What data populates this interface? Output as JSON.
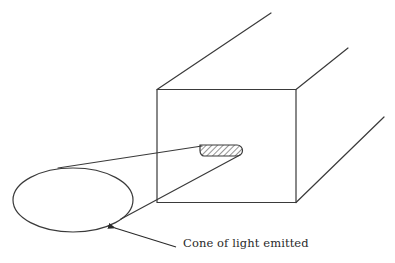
{
  "figure": {
    "caption": "Cone of light emitted",
    "ink_color": "#3a3a3a",
    "components": [
      {
        "name": "rectangular-block",
        "description": "Front face of a long rectangular bar shown in perspective"
      },
      {
        "name": "emitting-slot",
        "description": "Hatched elongated slot on the front face"
      },
      {
        "name": "light-cone",
        "description": "Two lines diverging from the slot"
      },
      {
        "name": "beam-ellipse",
        "description": "Elliptical cross-section of the emitted light cone"
      },
      {
        "name": "caption-arrow",
        "description": "Arrow pointing from caption to ellipse"
      }
    ]
  }
}
